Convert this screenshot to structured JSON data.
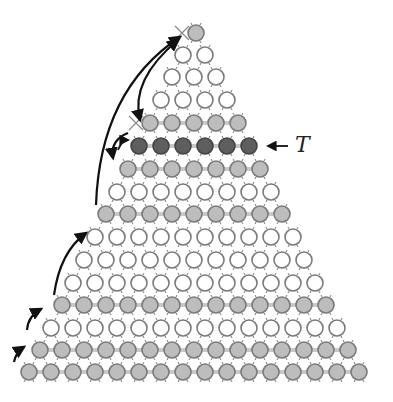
{
  "diagram": {
    "label": "T",
    "label_row_index": 10,
    "colors": {
      "white_fill": "#ffffff",
      "gray_fill": "#bdbdbd",
      "dark_fill": "#5e5e5e",
      "stroke": "#7a7a7a",
      "bond": "#c8c8c8",
      "arrow": "#111111"
    },
    "pitch": 22,
    "radius": 8,
    "rows": [
      {
        "count": 16,
        "y": 372,
        "x0": 29,
        "style": "gray",
        "cross": false
      },
      {
        "count": 15,
        "y": 350,
        "x0": 40,
        "style": "gray",
        "cross": false
      },
      {
        "count": 14,
        "y": 328,
        "x0": 51,
        "style": "white",
        "cross": false
      },
      {
        "count": 13,
        "y": 305,
        "x0": 62,
        "style": "gray",
        "cross": false
      },
      {
        "count": 12,
        "y": 283,
        "x0": 73,
        "style": "white",
        "cross": false
      },
      {
        "count": 11,
        "y": 260,
        "x0": 84,
        "style": "white",
        "cross": false
      },
      {
        "count": 10,
        "y": 237,
        "x0": 95,
        "style": "white",
        "cross": false
      },
      {
        "count": 9,
        "y": 214,
        "x0": 106,
        "style": "gray",
        "cross": false
      },
      {
        "count": 8,
        "y": 192,
        "x0": 117,
        "style": "white",
        "cross": false
      },
      {
        "count": 7,
        "y": 169,
        "x0": 128,
        "style": "gray",
        "cross": false
      },
      {
        "count": 6,
        "y": 146,
        "x0": 139,
        "style": "dark",
        "cross": false
      },
      {
        "count": 5,
        "y": 123,
        "x0": 150,
        "style": "gray",
        "cross": true
      },
      {
        "count": 4,
        "y": 100,
        "x0": 161,
        "style": "white",
        "cross": false
      },
      {
        "count": 3,
        "y": 77,
        "x0": 172,
        "style": "white",
        "cross": false
      },
      {
        "count": 2,
        "y": 55,
        "x0": 183,
        "style": "white",
        "cross": false
      },
      {
        "count": 1,
        "y": 33,
        "x0": 196,
        "style": "gray",
        "cross": true
      }
    ],
    "arrows": [
      {
        "name": "arrow-small-1",
        "d": "M14 362 Q16 352 24 347"
      },
      {
        "name": "arrow-small-2",
        "d": "M27 330 Q28 316 41 309"
      },
      {
        "name": "arrow-medium",
        "d": "M54 295 Q60 252 86 233"
      },
      {
        "name": "arrow-long-to-top",
        "d": "M96 205 Q100 90 180 37"
      },
      {
        "name": "arrow-top-down",
        "d": "M178 40 Q130 80 140 120",
        "note": "double-headed"
      },
      {
        "name": "arrow-curl",
        "d": "M128 133 Q110 140 113 158"
      }
    ],
    "t_arrow": {
      "x1": 288,
      "y1": 146,
      "x2": 268,
      "y2": 146
    },
    "t_label": {
      "x": 295,
      "y": 132
    }
  }
}
